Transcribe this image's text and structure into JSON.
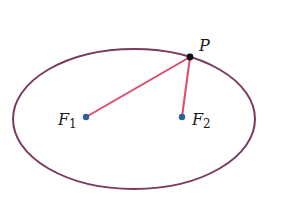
{
  "diagram": {
    "colors": {
      "ellipse": "#7a3a5e",
      "segments": "#e04a6a",
      "focus_points": "#2f5f9a",
      "point_p": "#111111",
      "text": "#1a1a1a"
    },
    "ellipse": {
      "cx": 134,
      "cy": 119,
      "rx": 121,
      "ry": 70
    },
    "points": {
      "P": {
        "label": "P",
        "x": 190,
        "y": 57
      },
      "F1": {
        "label": "F",
        "subscript": "1",
        "x": 86,
        "y": 117
      },
      "F2": {
        "label": "F",
        "subscript": "2",
        "x": 182,
        "y": 117
      }
    },
    "segments": [
      {
        "from": "F1",
        "to": "P"
      },
      {
        "from": "F2",
        "to": "P"
      }
    ]
  }
}
